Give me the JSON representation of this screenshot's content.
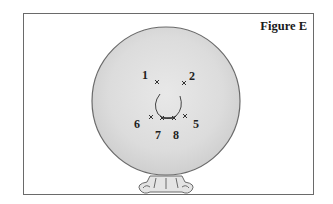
{
  "figure": {
    "title": "Figure E",
    "points": [
      {
        "label": "1",
        "x": 157,
        "y": 82
      },
      {
        "label": "2",
        "x": 184,
        "y": 83
      },
      {
        "label": "5",
        "x": 185,
        "y": 116
      },
      {
        "label": "6",
        "x": 151,
        "y": 117
      },
      {
        "label": "7",
        "x": 162,
        "y": 118
      },
      {
        "label": "8",
        "x": 174,
        "y": 118
      }
    ],
    "labels": {
      "p1": "1",
      "p2": "2",
      "p5": "5",
      "p6": "6",
      "p7": "7",
      "p8": "8"
    },
    "colors": {
      "sphere_fill": "#dedede",
      "sphere_stroke": "#6a6a6a",
      "mark": "#333333"
    }
  }
}
